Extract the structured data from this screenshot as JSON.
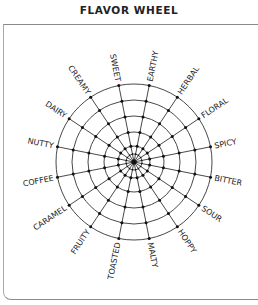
{
  "title": "FLAVOR WHEEL",
  "wheel": {
    "center": [
      134,
      162
    ],
    "ring_radii": [
      8,
      16,
      30,
      46,
      62,
      78
    ],
    "spoke_count": 16,
    "line_color": "#333333",
    "labels": [
      "SWEET",
      "EARTHY",
      "HERBAL",
      "FLORAL",
      "SPICY",
      "BITTER",
      "SOUR",
      "HOPPY",
      "MALTY",
      "TOASTED",
      "FRUITY",
      "CARAMEL",
      "COFFEE",
      "NUTTY",
      "DAIRY",
      "CREAMY"
    ]
  }
}
